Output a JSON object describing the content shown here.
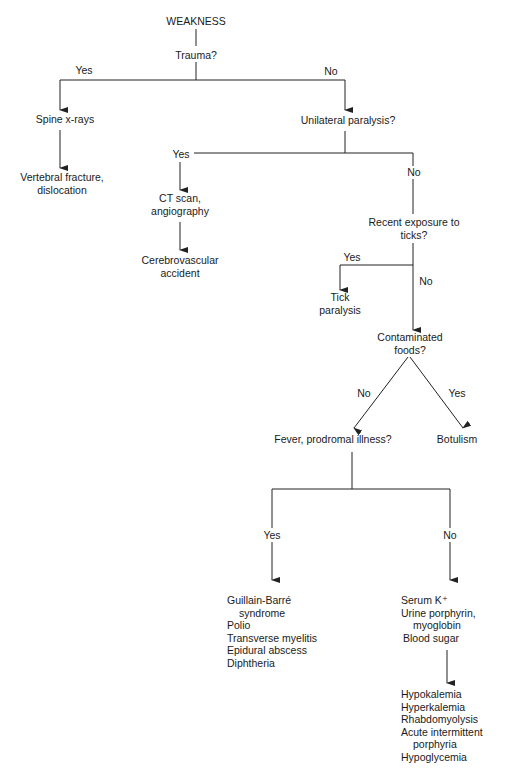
{
  "diagram": {
    "type": "decision-flowchart",
    "root": "WEAKNESS",
    "nodes": {
      "weakness": "WEAKNESS",
      "trauma": "Trauma?",
      "spine_xrays": "Spine x-rays",
      "vertebral": [
        "Vertebral fracture,",
        "dislocation"
      ],
      "unilateral": "Unilateral paralysis?",
      "ct_scan": [
        "CT scan,",
        "angiography"
      ],
      "cva": [
        "Cerebrovascular",
        "accident"
      ],
      "ticks": [
        "Recent exposure to",
        "ticks?"
      ],
      "tick_paralysis": [
        "Tick",
        "paralysis"
      ],
      "contaminated": [
        "Contaminated",
        "foods?"
      ],
      "fever": "Fever, prodromal illness?",
      "botulism": "Botulism",
      "yes_list": [
        "Guillain-Barré",
        "syndrome",
        "Polio",
        "Transverse myelitis",
        "Epidural abscess",
        "Diphtheria"
      ],
      "tests_list": [
        "Serum K⁺",
        "Urine porphyrin,",
        "myoglobin",
        "Blood sugar"
      ],
      "final_list": [
        "Hypokalemia",
        "Hyperkalemia",
        "Rhabdomyolysis",
        "Acute intermittent",
        "porphyria",
        "Hypoglycemia"
      ]
    },
    "edges": {
      "trauma_yes": "Yes",
      "trauma_no": "No",
      "unilateral_yes": "Yes",
      "unilateral_no": "No",
      "ticks_yes": "Yes",
      "ticks_no": "No",
      "contaminated_no": "No",
      "contaminated_yes": "Yes",
      "fever_yes": "Yes",
      "fever_no": "No"
    },
    "line_color": "#222222"
  }
}
